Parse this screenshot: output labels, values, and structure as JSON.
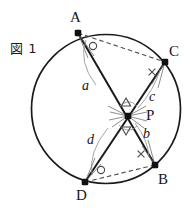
{
  "figure": {
    "title": "図 1",
    "title_pos": {
      "x": 10,
      "y": 38
    },
    "canvas": {
      "width": 190,
      "height": 213
    },
    "colors": {
      "stroke": "#1a1a1a",
      "chord": "#1a1a1a",
      "dashed": "#555555",
      "mark": "#7a7a7a",
      "text": "#161616",
      "background": "#ffffff"
    },
    "circle": {
      "name": "circumcircle",
      "cx": 106,
      "cy": 109,
      "r": 74.5
    },
    "points": [
      {
        "id": "A",
        "label": "A",
        "x": 78,
        "y": 33,
        "label_x": 70,
        "label_y": 10
      },
      {
        "id": "C",
        "label": "C",
        "x": 165,
        "y": 62,
        "label_x": 169,
        "label_y": 44
      },
      {
        "id": "P",
        "label": "P",
        "x": 128,
        "y": 116,
        "label_x": 146,
        "label_y": 108
      },
      {
        "id": "B",
        "label": "B",
        "x": 155,
        "y": 165,
        "label_x": 158,
        "label_y": 172
      },
      {
        "id": "D",
        "label": "D",
        "x": 85,
        "y": 182,
        "label_x": 76,
        "label_y": 188
      }
    ],
    "chords": [
      {
        "id": "AB",
        "from": "A",
        "to": "B",
        "style": "solid"
      },
      {
        "id": "CD",
        "from": "C",
        "to": "D",
        "style": "solid"
      },
      {
        "id": "AC",
        "from": "A",
        "to": "C",
        "style": "dashed"
      },
      {
        "id": "DB",
        "from": "D",
        "to": "B",
        "style": "dashed"
      }
    ],
    "segments": [
      {
        "id": "a",
        "label": "a",
        "between": "A-P",
        "label_x": 82,
        "label_y": 79
      },
      {
        "id": "c",
        "label": "c",
        "between": "P-C",
        "label_x": 149,
        "label_y": 90
      },
      {
        "id": "b",
        "label": "b",
        "between": "P-B",
        "label_x": 143,
        "label_y": 127
      },
      {
        "id": "d",
        "label": "d",
        "between": "P-D",
        "label_x": 87,
        "label_y": 133
      }
    ],
    "angle_marks": [
      {
        "id": "angle-A",
        "glyph": "circle",
        "at_vertex": "A",
        "x": 93,
        "y": 46
      },
      {
        "id": "angle-D",
        "glyph": "circle",
        "at_vertex": "D",
        "x": 101,
        "y": 170
      },
      {
        "id": "angle-C",
        "glyph": "cross",
        "at_vertex": "C",
        "x": 152,
        "y": 72
      },
      {
        "id": "angle-B",
        "glyph": "cross",
        "at_vertex": "B",
        "x": 141,
        "y": 154
      },
      {
        "id": "angle-P-upper",
        "glyph": "triangle",
        "at_vertex": "P",
        "x": 126,
        "y": 102
      },
      {
        "id": "angle-P-lower",
        "glyph": "triangle",
        "at_vertex": "P",
        "x": 126,
        "y": 131
      }
    ],
    "arc_markers": [
      {
        "id": "arc-A",
        "from_x": 86,
        "from_y": 40,
        "cx": 80,
        "cy": 66,
        "to_x": 95,
        "to_y": 83
      },
      {
        "id": "arc-C",
        "from_x": 160,
        "from_y": 70,
        "cx": 152,
        "cy": 88,
        "to_x": 139,
        "to_y": 107
      },
      {
        "id": "arc-B",
        "from_x": 149,
        "from_y": 157,
        "cx": 146,
        "cy": 140,
        "to_x": 136,
        "to_y": 124
      },
      {
        "id": "arc-D",
        "from_x": 92,
        "from_y": 175,
        "cx": 90,
        "cy": 152,
        "to_x": 106,
        "to_y": 130
      },
      {
        "id": "arc-P-up",
        "from_x": 120,
        "from_y": 108,
        "cx": 128,
        "cy": 100,
        "to_x": 136,
        "to_y": 107
      },
      {
        "id": "arc-P-dn",
        "from_x": 120,
        "from_y": 124,
        "cx": 128,
        "cy": 133,
        "to_x": 136,
        "to_y": 125
      }
    ]
  }
}
